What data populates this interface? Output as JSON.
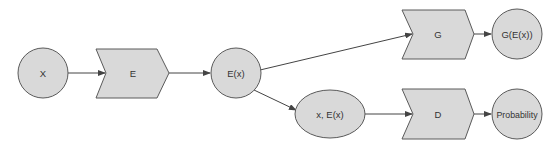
{
  "diagram": {
    "title": "",
    "colors": {
      "node_fill": "#d9d9d9",
      "node_stroke": "#5a5a5a",
      "edge": "#444444",
      "text": "#333333",
      "background": "#ffffff"
    },
    "nodes": [
      {
        "id": "X",
        "label": "X",
        "shape": "circle"
      },
      {
        "id": "E",
        "label": "E",
        "shape": "chevron"
      },
      {
        "id": "Ex",
        "label": "E(x)",
        "shape": "circle"
      },
      {
        "id": "xEx",
        "label": "x, E(x)",
        "shape": "ellipse"
      },
      {
        "id": "G",
        "label": "G",
        "shape": "chevron"
      },
      {
        "id": "GEx",
        "label": "G(E(x))",
        "shape": "circle"
      },
      {
        "id": "D",
        "label": "D",
        "shape": "chevron"
      },
      {
        "id": "Prob",
        "label": "Probability",
        "shape": "circle"
      }
    ],
    "edges": [
      {
        "from": "X",
        "to": "E"
      },
      {
        "from": "E",
        "to": "E(x)"
      },
      {
        "from": "E(x)",
        "to": "G"
      },
      {
        "from": "E(x)",
        "to": "x, E(x)"
      },
      {
        "from": "G",
        "to": "G(E(x))"
      },
      {
        "from": "x, E(x)",
        "to": "D"
      },
      {
        "from": "D",
        "to": "Probability"
      }
    ]
  }
}
